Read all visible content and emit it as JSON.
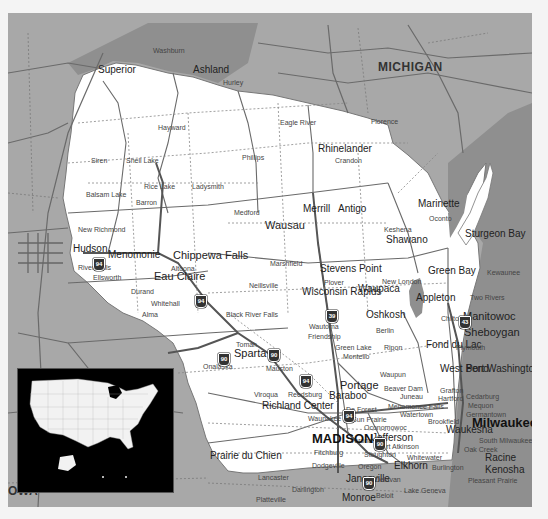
{
  "map": {
    "title": "Wisconsin",
    "colors": {
      "state_fill": "#ffffff",
      "neighbor_fill": "#a8a8a8",
      "water_fill": "#8c8c8c",
      "road": "#6a6a6a",
      "interstate": "#555555",
      "inset_bg": "#000000",
      "frame_bg": "#f4f4f4"
    },
    "neighbor_states": [
      {
        "name": "MICHIGAN"
      },
      {
        "name": "OWA"
      }
    ],
    "major_cities": [
      {
        "name": "MADISON"
      },
      {
        "name": "Milwaukee"
      }
    ],
    "cities": [
      {
        "name": "Superior"
      },
      {
        "name": "Washburn"
      },
      {
        "name": "Ashland"
      },
      {
        "name": "Hurley"
      },
      {
        "name": "Hayward"
      },
      {
        "name": "Eagle River"
      },
      {
        "name": "Florence"
      },
      {
        "name": "Rhinelander"
      },
      {
        "name": "Crandon"
      },
      {
        "name": "Siren"
      },
      {
        "name": "Shell Lake"
      },
      {
        "name": "Phillips"
      },
      {
        "name": "Rice Lake"
      },
      {
        "name": "Ladysmith"
      },
      {
        "name": "Balsam Lake"
      },
      {
        "name": "Barron"
      },
      {
        "name": "Medford"
      },
      {
        "name": "Merrill"
      },
      {
        "name": "Antigo"
      },
      {
        "name": "Marinette"
      },
      {
        "name": "Oconto"
      },
      {
        "name": "Wausau"
      },
      {
        "name": "Keshena"
      },
      {
        "name": "Shawano"
      },
      {
        "name": "Sturgeon Bay"
      },
      {
        "name": "New Richmond"
      },
      {
        "name": "Hudson"
      },
      {
        "name": "Menomonie"
      },
      {
        "name": "Chippewa Falls"
      },
      {
        "name": "Altoona"
      },
      {
        "name": "River Falls"
      },
      {
        "name": "Ellsworth"
      },
      {
        "name": "Eau Claire"
      },
      {
        "name": "Marshfield"
      },
      {
        "name": "Stevens Point"
      },
      {
        "name": "Green Bay"
      },
      {
        "name": "Kewaunee"
      },
      {
        "name": "Durand"
      },
      {
        "name": "Neillsville"
      },
      {
        "name": "Plover"
      },
      {
        "name": "Waupaca"
      },
      {
        "name": "New London"
      },
      {
        "name": "Wisconsin Rapids"
      },
      {
        "name": "Appleton"
      },
      {
        "name": "Two Rivers"
      },
      {
        "name": "Whitehall"
      },
      {
        "name": "Alma"
      },
      {
        "name": "Black River Falls"
      },
      {
        "name": "Oshkosh"
      },
      {
        "name": "Chilton"
      },
      {
        "name": "Manitowoc"
      },
      {
        "name": "Wautoma"
      },
      {
        "name": "Berlin"
      },
      {
        "name": "Friendship"
      },
      {
        "name": "Sheboygan"
      },
      {
        "name": "Tomah"
      },
      {
        "name": "Sparta"
      },
      {
        "name": "Green Lake"
      },
      {
        "name": "Ripon"
      },
      {
        "name": "Fond du Lac"
      },
      {
        "name": "Plymouth"
      },
      {
        "name": "Onalaska"
      },
      {
        "name": "Montello"
      },
      {
        "name": "Mauston"
      },
      {
        "name": "Waupun"
      },
      {
        "name": "West Bend"
      },
      {
        "name": "Port Washington"
      },
      {
        "name": "Portage"
      },
      {
        "name": "Beaver Dam"
      },
      {
        "name": "Grafton"
      },
      {
        "name": "Viroqua"
      },
      {
        "name": "Reedsburg"
      },
      {
        "name": "Juneau"
      },
      {
        "name": "Hartford"
      },
      {
        "name": "Cedarburg"
      },
      {
        "name": "Baraboo"
      },
      {
        "name": "Menomonee Falls"
      },
      {
        "name": "Mequon"
      },
      {
        "name": "Richland Center"
      },
      {
        "name": "De Forest"
      },
      {
        "name": "Watertown"
      },
      {
        "name": "Germantown"
      },
      {
        "name": "Sun Prairie"
      },
      {
        "name": "Brookfield"
      },
      {
        "name": "Waunakee"
      },
      {
        "name": "Oconomowoc"
      },
      {
        "name": "Waukesha"
      },
      {
        "name": "Jefferson"
      },
      {
        "name": "Verona"
      },
      {
        "name": "South Milwaukee"
      },
      {
        "name": "Fort Atkinson"
      },
      {
        "name": "Oak Creek"
      },
      {
        "name": "Prairie du Chien"
      },
      {
        "name": "Fitchburg"
      },
      {
        "name": "Stoughton"
      },
      {
        "name": "Whitewater"
      },
      {
        "name": "Racine"
      },
      {
        "name": "Dodgeville"
      },
      {
        "name": "Oregon"
      },
      {
        "name": "Elkhorn"
      },
      {
        "name": "Burlington"
      },
      {
        "name": "Kenosha"
      },
      {
        "name": "Lancaster"
      },
      {
        "name": "Janesville"
      },
      {
        "name": "Delavan"
      },
      {
        "name": "Pleasant Prairie"
      },
      {
        "name": "Darlington"
      },
      {
        "name": "Beloit"
      },
      {
        "name": "Lake Geneva"
      },
      {
        "name": "Platteville"
      },
      {
        "name": "Monroe"
      }
    ],
    "interstate_shields": [
      "94",
      "94",
      "94",
      "39",
      "90",
      "90",
      "94",
      "43",
      "90",
      "90",
      "90"
    ],
    "inset": {
      "label": "USA locator inset",
      "highlight": "Wisconsin"
    }
  }
}
